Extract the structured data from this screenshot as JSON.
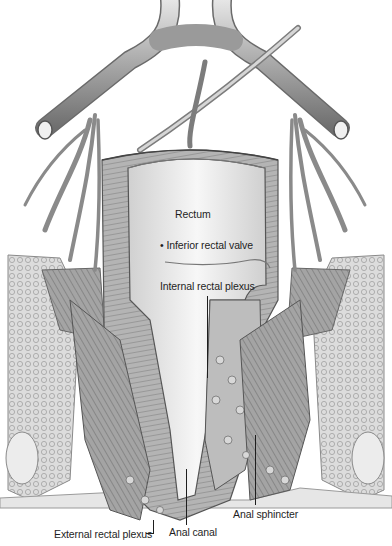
{
  "figure": {
    "colors": {
      "background": "#ffffff",
      "vessel": "#8c8c8c",
      "vessel_light": "#d4d4d4",
      "tissue": "#b8b8b8",
      "lumen": "#ececec",
      "muscle": "#7a7a7a",
      "label": "#1e1e1e"
    },
    "labels": [
      {
        "id": "rectum",
        "text": "Rectum"
      },
      {
        "id": "inferior_rectal_valve",
        "text": "• Inferior rectal valve"
      },
      {
        "id": "internal_rectal_plexus",
        "text": "Internal rectal plexus"
      },
      {
        "id": "external_rectal_plexus",
        "text": "External rectal plexus"
      },
      {
        "id": "anal_canal",
        "text": "Anal canal"
      },
      {
        "id": "anal_sphincter",
        "text": "Anal sphincter"
      }
    ]
  }
}
